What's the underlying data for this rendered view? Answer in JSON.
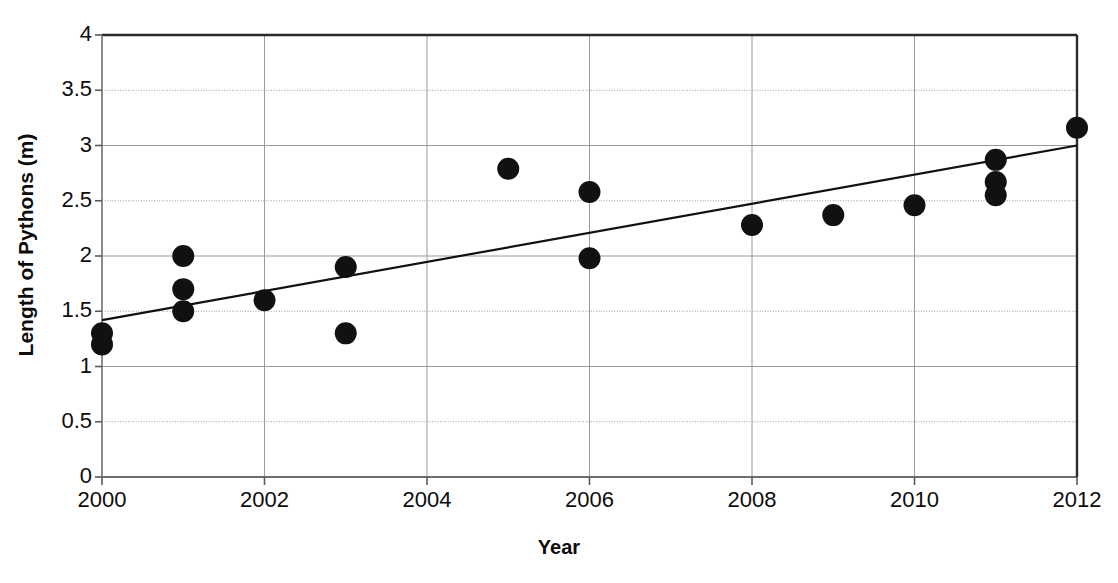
{
  "chart_data": {
    "type": "scatter",
    "title": "",
    "xlabel": "Year",
    "ylabel": "Length of Pythons (m)",
    "xlim": [
      2000,
      2012
    ],
    "ylim": [
      0,
      4
    ],
    "xticks": [
      "2000",
      "2002",
      "2004",
      "2006",
      "2008",
      "2010",
      "2012"
    ],
    "xtick_values": [
      2000,
      2002,
      2004,
      2006,
      2008,
      2010,
      2012
    ],
    "yticks": [
      "0",
      "0.5",
      "1",
      "1.5",
      "2",
      "2.5",
      "3",
      "3.5",
      "4"
    ],
    "ytick_values": [
      0,
      0.5,
      1,
      1.5,
      2,
      2.5,
      3,
      3.5,
      4
    ],
    "grid": true,
    "legend": "none",
    "marker_color": "#111111",
    "marker_shape": "circle",
    "marker_radius": 11,
    "line_color": "#111111",
    "points": [
      {
        "x": 2000,
        "y": 1.3
      },
      {
        "x": 2000,
        "y": 1.2
      },
      {
        "x": 2001,
        "y": 2.0
      },
      {
        "x": 2001,
        "y": 1.7
      },
      {
        "x": 2001,
        "y": 1.5
      },
      {
        "x": 2002,
        "y": 1.6
      },
      {
        "x": 2003,
        "y": 1.9
      },
      {
        "x": 2003,
        "y": 1.3
      },
      {
        "x": 2005,
        "y": 2.79
      },
      {
        "x": 2006,
        "y": 2.58
      },
      {
        "x": 2006,
        "y": 1.98
      },
      {
        "x": 2008,
        "y": 2.28
      },
      {
        "x": 2009,
        "y": 2.37
      },
      {
        "x": 2010,
        "y": 2.46
      },
      {
        "x": 2011,
        "y": 2.87
      },
      {
        "x": 2011,
        "y": 2.67
      },
      {
        "x": 2011,
        "y": 2.55
      },
      {
        "x": 2012,
        "y": 3.16
      }
    ],
    "trendline": {
      "type": "linear",
      "x0": 2000,
      "y0": 1.42,
      "x1": 2012,
      "y1": 3.0
    }
  }
}
